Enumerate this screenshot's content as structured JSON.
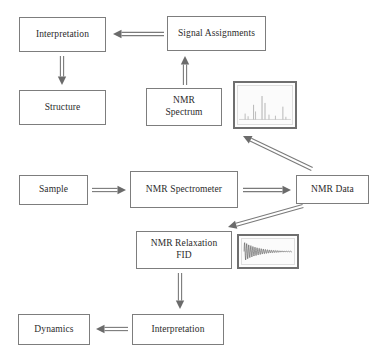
{
  "diagram": {
    "style": {
      "box_border_color": "#7d7d7d",
      "arrow_color": "#7a7a7a",
      "arrow_head_color": "#6b6b6b",
      "text_color": "#2b2b2b",
      "background": "#ffffff",
      "thumb_frame_color": "#6f6f6f"
    },
    "nodes": [
      {
        "id": "interpretation_top",
        "label": "Interpretation",
        "x": 19,
        "y": 17,
        "w": 87,
        "h": 35
      },
      {
        "id": "signal_assignments",
        "label": "Signal Assignments",
        "x": 167,
        "y": 16,
        "w": 99,
        "h": 35
      },
      {
        "id": "structure",
        "label": "Structure",
        "x": 19,
        "y": 90,
        "w": 87,
        "h": 35
      },
      {
        "id": "nmr_spectrum",
        "label": "NMR\nSpectrum",
        "x": 146,
        "y": 88,
        "w": 76,
        "h": 38
      },
      {
        "id": "sample",
        "label": "Sample",
        "x": 19,
        "y": 175,
        "w": 69,
        "h": 30
      },
      {
        "id": "nmr_spectrometer",
        "label": "NMR Spectrometer",
        "x": 130,
        "y": 171,
        "w": 108,
        "h": 37
      },
      {
        "id": "nmr_data",
        "label": "NMR Data",
        "x": 296,
        "y": 175,
        "w": 73,
        "h": 29
      },
      {
        "id": "nmr_relaxation_fid",
        "label": "NMR Relaxation\nFID",
        "x": 136,
        "y": 231,
        "w": 96,
        "h": 38
      },
      {
        "id": "interpretation_bottom",
        "label": "Interpretation",
        "x": 132,
        "y": 314,
        "w": 92,
        "h": 31
      },
      {
        "id": "dynamics",
        "label": "Dynamics",
        "x": 18,
        "y": 314,
        "w": 72,
        "h": 31
      }
    ],
    "thumbnails": [
      {
        "id": "nmr_spectrum_thumbnail",
        "name": "nmr-spectrum-thumbnail",
        "kind": "spectrum",
        "x": 233,
        "y": 81,
        "w": 64,
        "h": 48,
        "peaks": [
          {
            "pos": 0.1,
            "height": 0.22,
            "width": 0.012
          },
          {
            "pos": 0.16,
            "height": 0.12,
            "width": 0.01
          },
          {
            "pos": 0.27,
            "height": 0.55,
            "width": 0.013
          },
          {
            "pos": 0.31,
            "height": 0.3,
            "width": 0.011
          },
          {
            "pos": 0.44,
            "height": 0.88,
            "width": 0.014
          },
          {
            "pos": 0.5,
            "height": 0.62,
            "width": 0.013
          },
          {
            "pos": 0.58,
            "height": 0.18,
            "width": 0.01
          },
          {
            "pos": 0.71,
            "height": 0.14,
            "width": 0.01
          },
          {
            "pos": 0.86,
            "height": 0.48,
            "width": 0.013
          },
          {
            "pos": 0.92,
            "height": 0.1,
            "width": 0.01
          }
        ]
      },
      {
        "id": "fid_thumbnail",
        "name": "fid-decay-thumbnail",
        "kind": "fid",
        "x": 237,
        "y": 234,
        "w": 62,
        "h": 35,
        "decay_constant": 3.4,
        "oscillations": 46
      }
    ],
    "arrows": [
      {
        "id": "signal_to_interpretation",
        "name": "arrow-signal-assignments-to-interpretation",
        "from": "signal_assignments",
        "to": "interpretation_top",
        "x1": 164,
        "y1": 34,
        "x2": 113,
        "y2": 34,
        "style": "double-line"
      },
      {
        "id": "interpretation_to_structure",
        "name": "arrow-interpretation-to-structure",
        "from": "interpretation_top",
        "to": "structure",
        "x1": 62,
        "y1": 56,
        "x2": 62,
        "y2": 85,
        "style": "double-line"
      },
      {
        "id": "spectrum_to_signal",
        "name": "arrow-nmr-spectrum-to-signal-assignments",
        "from": "nmr_spectrum",
        "to": "signal_assignments",
        "x1": 185,
        "y1": 85,
        "x2": 185,
        "y2": 56,
        "style": "double-line"
      },
      {
        "id": "data_to_spectrum_image",
        "name": "arrow-nmr-data-to-spectrum-image",
        "from": "nmr_data",
        "to": "nmr_spectrum_thumbnail",
        "x1": 312,
        "y1": 169,
        "x2": 243,
        "y2": 136,
        "style": "double-line-diagonal"
      },
      {
        "id": "sample_to_spectrometer",
        "name": "arrow-sample-to-nmr-spectrometer",
        "from": "sample",
        "to": "nmr_spectrometer",
        "x1": 92,
        "y1": 190,
        "x2": 126,
        "y2": 190,
        "style": "double-line"
      },
      {
        "id": "spectrometer_to_data",
        "name": "arrow-nmr-spectrometer-to-nmr-data",
        "from": "nmr_spectrometer",
        "to": "nmr_data",
        "x1": 243,
        "y1": 190,
        "x2": 291,
        "y2": 190,
        "style": "double-line"
      },
      {
        "id": "data_to_relaxation",
        "name": "arrow-nmr-data-to-nmr-relaxation-fid",
        "from": "nmr_data",
        "to": "nmr_relaxation_fid",
        "x1": 303,
        "y1": 206,
        "x2": 228,
        "y2": 227,
        "style": "double-line-diagonal"
      },
      {
        "id": "relaxation_to_interpretation",
        "name": "arrow-nmr-relaxation-fid-to-interpretation",
        "from": "nmr_relaxation_fid",
        "to": "interpretation_bottom",
        "x1": 180,
        "y1": 273,
        "x2": 180,
        "y2": 309,
        "style": "double-line"
      },
      {
        "id": "interpretation_to_dynamics",
        "name": "arrow-interpretation-to-dynamics",
        "from": "interpretation_bottom",
        "to": "dynamics",
        "x1": 128,
        "y1": 329,
        "x2": 96,
        "y2": 329,
        "style": "double-line"
      }
    ]
  }
}
